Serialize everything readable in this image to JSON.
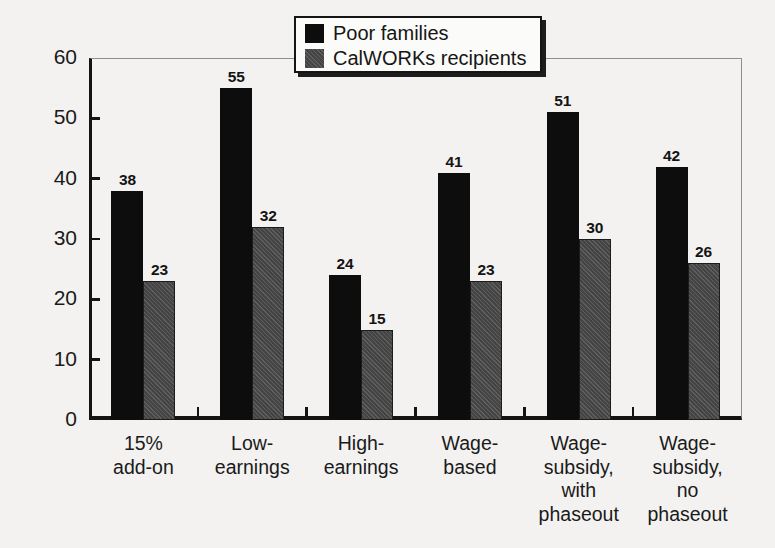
{
  "chart_data": {
    "type": "bar",
    "title": "",
    "xlabel": "",
    "ylabel": "Percentage",
    "ylim": [
      0,
      60
    ],
    "yticks": [
      0,
      10,
      20,
      30,
      40,
      50,
      60
    ],
    "grid": false,
    "legend_position": "top-center",
    "categories": [
      "15%\nadd-on",
      "Low-\nearnings",
      "High-\nearnings",
      "Wage-\nbased",
      "Wage-\nsubsidy,\nwith\nphaseout",
      "Wage-\nsubsidy,\nno\nphaseout"
    ],
    "series": [
      {
        "name": "Poor families",
        "color": "#0d0d0d",
        "values": [
          38,
          55,
          24,
          41,
          51,
          42
        ]
      },
      {
        "name": "CalWORKs recipients",
        "color": "#4c4c4c",
        "values": [
          23,
          32,
          15,
          23,
          30,
          26
        ]
      }
    ]
  },
  "legend": {
    "items": [
      {
        "label": "Poor families",
        "swatch": "black-square-icon"
      },
      {
        "label": "CalWORKs recipients",
        "swatch": "gray-hatched-square-icon"
      }
    ]
  },
  "axis": {
    "y_title": "Percentage",
    "y_tick_labels": [
      "60",
      "50",
      "40",
      "30",
      "20",
      "10",
      "0"
    ]
  },
  "bar_labels": {
    "poor": [
      "38",
      "55",
      "24",
      "41",
      "51",
      "42"
    ],
    "calworks": [
      "23",
      "32",
      "15",
      "23",
      "30",
      "26"
    ]
  },
  "x_labels": [
    "15%\nadd-on",
    "Low-\nearnings",
    "High-\nearnings",
    "Wage-\nbased",
    "Wage-\nsubsidy,\nwith\nphaseout",
    "Wage-\nsubsidy,\nno\nphaseout"
  ],
  "colors": {
    "background": "#f3f2f0",
    "axis": "#141414",
    "frame_light": "#8e8e8e",
    "series_poor": "#0d0d0d",
    "series_calworks": "#4c4c4c"
  }
}
